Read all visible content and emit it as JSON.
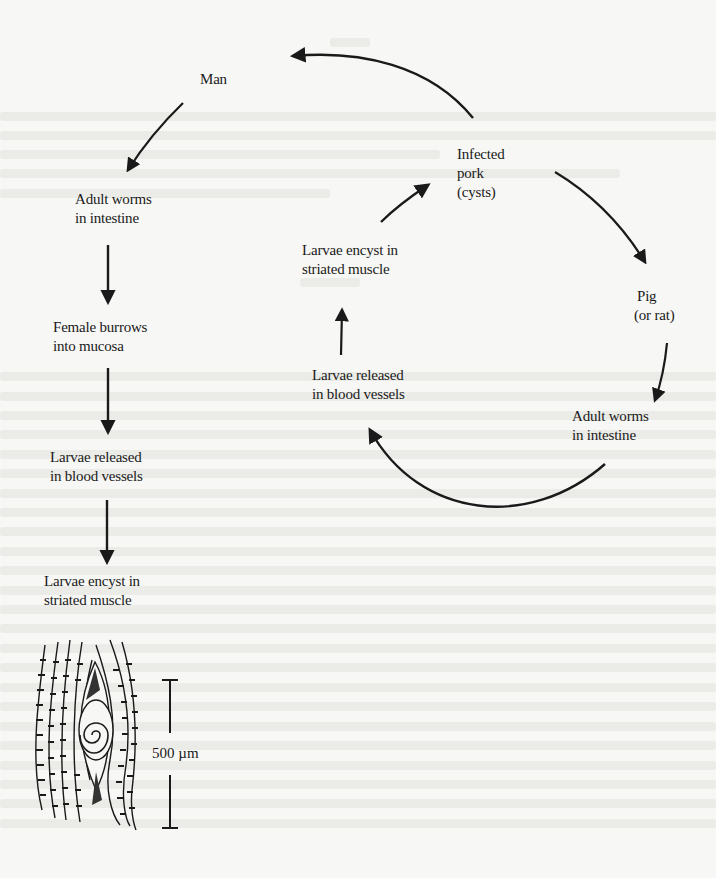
{
  "figure": {
    "type": "life-cycle diagram",
    "left_column": {
      "nodes": [
        {
          "id": "man",
          "lines": [
            "Man"
          ]
        },
        {
          "id": "adult-worms",
          "lines": [
            "Adult worms",
            "in intestine"
          ]
        },
        {
          "id": "female-burrows",
          "lines": [
            "Female burrows",
            "into mucosa"
          ]
        },
        {
          "id": "larvae-released",
          "lines": [
            "Larvae released",
            "in blood vessels"
          ]
        },
        {
          "id": "larvae-encyst",
          "lines": [
            "Larvae encyst in",
            "striated muscle"
          ]
        }
      ]
    },
    "right_cycle": {
      "nodes": [
        {
          "id": "infected-pork",
          "lines": [
            "Infected",
            "pork",
            "(cysts)"
          ]
        },
        {
          "id": "pig",
          "lines": [
            "Pig",
            "(or rat)"
          ]
        },
        {
          "id": "adult-worms",
          "lines": [
            "Adult worms",
            "in intestine"
          ]
        },
        {
          "id": "larvae-released",
          "lines": [
            "Larvae released",
            "in blood vessels"
          ]
        },
        {
          "id": "larvae-encyst",
          "lines": [
            "Larvae encyst in",
            "striated muscle"
          ]
        }
      ]
    },
    "scale_bar": {
      "label": "500 µm"
    },
    "colors": {
      "ink": "#1a1a1a",
      "paper": "#f7f7f5",
      "showthrough": "#e9e9e6"
    }
  }
}
